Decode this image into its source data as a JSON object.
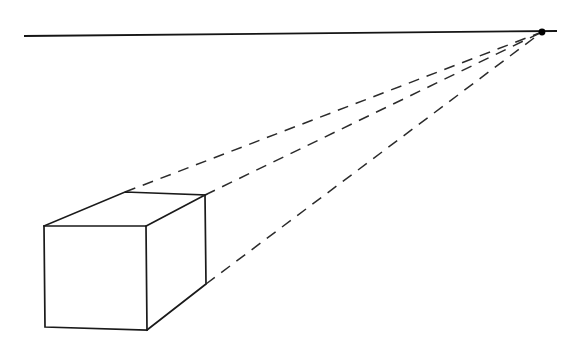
{
  "figure": {
    "background_color": "#ffffff",
    "line_color": "#1a1a1a",
    "dashed_line_color": "#2b2b2b",
    "canvas": {
      "width": 580,
      "height": 347
    }
  },
  "chart_data": {
    "type": "diagram",
    "xlabel": "",
    "ylabel": "",
    "xlim": [
      0,
      580
    ],
    "ylim": [
      0,
      347
    ],
    "grid": false,
    "legend": "none",
    "vanishing_point": {
      "x": 542,
      "y": 32
    },
    "horizon_line": {
      "x1": 24,
      "y1": 36,
      "x2": 557,
      "y2": 31
    },
    "box_vertices": {
      "front_top_left": {
        "x": 44,
        "y": 226
      },
      "front_top_right": {
        "x": 146,
        "y": 226
      },
      "front_bottom_right": {
        "x": 147,
        "y": 330
      },
      "front_bottom_left": {
        "x": 45,
        "y": 327
      },
      "back_top_left": {
        "x": 125,
        "y": 192
      },
      "back_top_right": {
        "x": 205,
        "y": 195
      },
      "back_bottom_right": {
        "x": 206,
        "y": 284
      }
    },
    "solid_edges": [
      {
        "name": "front-face-top",
        "x1": 44,
        "y1": 226,
        "x2": 146,
        "y2": 226
      },
      {
        "name": "front-face-right",
        "x1": 146,
        "y1": 226,
        "x2": 147,
        "y2": 330
      },
      {
        "name": "front-face-bottom",
        "x1": 147,
        "y1": 330,
        "x2": 45,
        "y2": 327
      },
      {
        "name": "front-face-left",
        "x1": 45,
        "y1": 327,
        "x2": 44,
        "y2": 226
      },
      {
        "name": "top-receding-left",
        "x1": 44,
        "y1": 226,
        "x2": 125,
        "y2": 192
      },
      {
        "name": "top-back",
        "x1": 125,
        "y1": 192,
        "x2": 205,
        "y2": 195
      },
      {
        "name": "top-receding-right",
        "x1": 205,
        "y1": 195,
        "x2": 146,
        "y2": 226
      },
      {
        "name": "side-back-vertical",
        "x1": 205,
        "y1": 195,
        "x2": 206,
        "y2": 284
      },
      {
        "name": "side-bottom-receding",
        "x1": 206,
        "y1": 284,
        "x2": 147,
        "y2": 330
      }
    ],
    "dashed_guides": [
      {
        "name": "guide-from-back-top-left",
        "x1": 125,
        "y1": 192,
        "x2": 542,
        "y2": 32
      },
      {
        "name": "guide-from-back-top-right",
        "x1": 205,
        "y1": 195,
        "x2": 542,
        "y2": 32
      },
      {
        "name": "guide-from-back-bottom-right",
        "x1": 206,
        "y1": 284,
        "x2": 542,
        "y2": 32
      }
    ],
    "annotations": []
  }
}
